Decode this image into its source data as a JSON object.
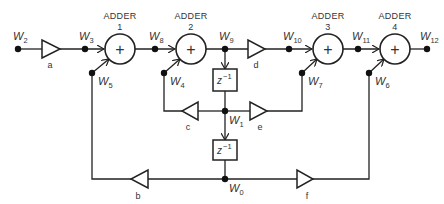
{
  "diagram": {
    "type": "digital filter signal-flow block diagram",
    "colors": {
      "stroke": "#222222",
      "text": "#333333",
      "background": "#ffffff"
    },
    "adders": [
      {
        "id": "adder-1",
        "title": "ADDER",
        "number": "1",
        "symbol": "+"
      },
      {
        "id": "adder-2",
        "title": "ADDER",
        "number": "2",
        "symbol": "+"
      },
      {
        "id": "adder-3",
        "title": "ADDER",
        "number": "3",
        "symbol": "+"
      },
      {
        "id": "adder-4",
        "title": "ADDER",
        "number": "4",
        "symbol": "+"
      }
    ],
    "multipliers": [
      {
        "id": "a",
        "label": "a"
      },
      {
        "id": "b",
        "label": "b"
      },
      {
        "id": "c",
        "label": "c"
      },
      {
        "id": "d",
        "label": "d"
      },
      {
        "id": "e",
        "label": "e"
      },
      {
        "id": "f",
        "label": "f"
      }
    ],
    "delays": [
      {
        "id": "delay-1",
        "label": "z",
        "exponent": "−1"
      },
      {
        "id": "delay-2",
        "label": "z",
        "exponent": "−1"
      }
    ],
    "nodes": [
      {
        "id": "W0",
        "base": "W",
        "sub": "0"
      },
      {
        "id": "W1",
        "base": "W",
        "sub": "1"
      },
      {
        "id": "W2",
        "base": "W",
        "sub": "2"
      },
      {
        "id": "W3",
        "base": "W",
        "sub": "3"
      },
      {
        "id": "W4",
        "base": "W",
        "sub": "4"
      },
      {
        "id": "W5",
        "base": "W",
        "sub": "5"
      },
      {
        "id": "W6",
        "base": "W",
        "sub": "6"
      },
      {
        "id": "W7",
        "base": "W",
        "sub": "7"
      },
      {
        "id": "W8",
        "base": "W",
        "sub": "8"
      },
      {
        "id": "W9",
        "base": "W",
        "sub": "9"
      },
      {
        "id": "W10",
        "base": "W",
        "sub": "10"
      },
      {
        "id": "W11",
        "base": "W",
        "sub": "11"
      },
      {
        "id": "W12",
        "base": "W",
        "sub": "12"
      }
    ]
  }
}
